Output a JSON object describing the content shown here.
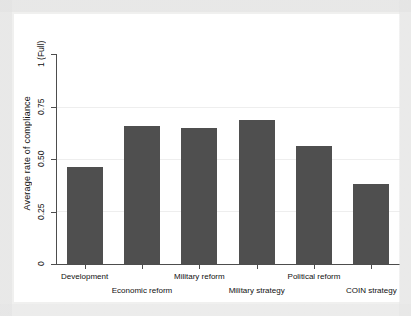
{
  "chart_data": {
    "type": "bar",
    "title": "",
    "subtitle": "",
    "xlabel": "",
    "ylabel": "Average rate of compliance",
    "categories": [
      "Development",
      "Economic reform",
      "Military reform",
      "Military strategy",
      "Political reform",
      "COIN strategy"
    ],
    "values": [
      0.46,
      0.655,
      0.65,
      0.685,
      0.56,
      0.38
    ],
    "ylim": [
      0,
      1
    ],
    "ytick_values": [
      0,
      0.25,
      0.5,
      0.75,
      1
    ],
    "ytick_labels": [
      "0",
      "0.25",
      "0.50",
      "0.75",
      "1 (Full)"
    ],
    "grid": true,
    "legend": "none",
    "bar_color": "#4f4f4f",
    "axis_color": "#4d4d4d",
    "plot_background": "#ffffff",
    "graph_background": "#f0f0ef"
  }
}
